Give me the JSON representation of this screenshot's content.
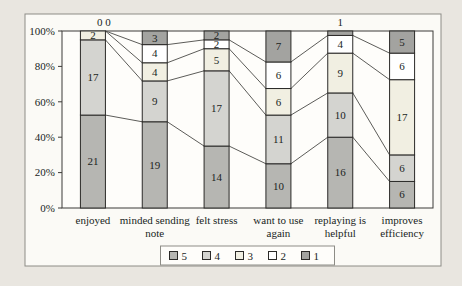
{
  "colors": {
    "page_bg": "#e9e6e0",
    "chart_bg": "#fbfaf6",
    "plot_bg": "#fefdfa",
    "frame_border": "#8d8c86",
    "axis_border": "#3c3b38",
    "segment_border": "#2b2a28",
    "series_line": "#4a4946",
    "text": "#201f1d"
  },
  "chart_data": {
    "type": "bar",
    "variant": "100-percent-stacked-column-with-series-lines",
    "title": "",
    "xlabel": "",
    "ylabel": "",
    "ylim": [
      0,
      100
    ],
    "grid": false,
    "data_labels": true,
    "categories": [
      "enjoyed",
      "minded sending\nnote",
      "felt stress",
      "want to use\nagain",
      "replaying is\nhelpful",
      "improves\nefficiency"
    ],
    "series": [
      {
        "name": "5",
        "color": "#b6b6b2",
        "values": [
          21,
          19,
          14,
          10,
          16,
          6
        ]
      },
      {
        "name": "4",
        "color": "#d4d4d0",
        "values": [
          17,
          9,
          17,
          11,
          10,
          6
        ]
      },
      {
        "name": "3",
        "color": "#f1efe2",
        "values": [
          2,
          4,
          5,
          6,
          9,
          17
        ]
      },
      {
        "name": "2",
        "color": "#ffffff",
        "values": [
          0,
          4,
          2,
          6,
          4,
          6
        ]
      },
      {
        "name": "1",
        "color": "#a3a3a0",
        "values": [
          0,
          3,
          2,
          7,
          1,
          5
        ]
      }
    ],
    "legend": {
      "labels": [
        "5",
        "4",
        "3",
        "2",
        "1"
      ],
      "position": "bottom"
    },
    "y_ticks": [
      "0%",
      "20%",
      "40%",
      "60%",
      "80%",
      "100%"
    ],
    "above_bar_labels_note": "labels for zero or too-small segments are drawn above the bar: 'enjoyed' shows '0 0', 'replaying is helpful' shows '1'"
  }
}
